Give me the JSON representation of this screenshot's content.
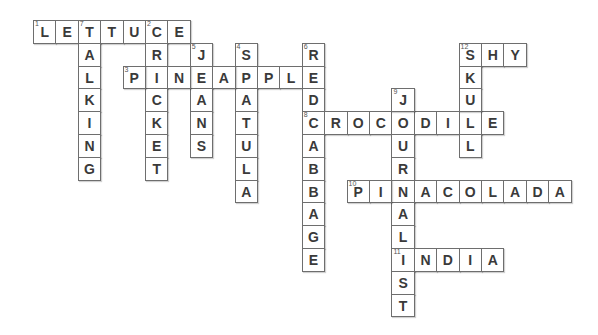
{
  "puzzle": {
    "type": "crossword",
    "grid_origin": {
      "x": 33,
      "y": 20
    },
    "cell_size": {
      "w": 22.4,
      "h": 22.8
    },
    "colors": {
      "border": "#6e6e6e",
      "letter": "#3a3a3a",
      "background": "#ffffff"
    },
    "words": [
      {
        "number": "1",
        "direction": "across",
        "row": 0,
        "col": 0,
        "answer": "LETTUCE"
      },
      {
        "number": "2",
        "direction": "down",
        "row": 0,
        "col": 5,
        "answer": "CRICKET"
      },
      {
        "number": "3",
        "direction": "across",
        "row": 2,
        "col": 4,
        "answer": "PINEAPPLE"
      },
      {
        "number": "4",
        "direction": "down",
        "row": 1,
        "col": 9,
        "answer": "SPATULA"
      },
      {
        "number": "5",
        "direction": "down",
        "row": 1,
        "col": 7,
        "answer": "JEANS"
      },
      {
        "number": "6",
        "direction": "down",
        "row": 1,
        "col": 12,
        "answer": "REDCABBAGE"
      },
      {
        "number": "7",
        "direction": "down",
        "row": 0,
        "col": 2,
        "answer": "TALKING"
      },
      {
        "number": "8",
        "direction": "across",
        "row": 4,
        "col": 12,
        "answer": "CROCODILE"
      },
      {
        "number": "9",
        "direction": "down",
        "row": 3,
        "col": 16,
        "answer": "JOURNALIST"
      },
      {
        "number": "10",
        "direction": "across",
        "row": 7,
        "col": 14,
        "answer": "PINACOLADA"
      },
      {
        "number": "11",
        "direction": "across",
        "row": 10,
        "col": 16,
        "answer": "INDIA"
      },
      {
        "number": "12",
        "direction": "across",
        "row": 1,
        "col": 19,
        "answer": "SHY"
      },
      {
        "number": "12",
        "direction": "down",
        "row": 1,
        "col": 19,
        "answer": "SKULL"
      }
    ],
    "cells": [
      {
        "r": 0,
        "c": 0,
        "ch": "L",
        "n": "1"
      },
      {
        "r": 0,
        "c": 1,
        "ch": "E"
      },
      {
        "r": 0,
        "c": 2,
        "ch": "T",
        "n": "7"
      },
      {
        "r": 0,
        "c": 3,
        "ch": "T"
      },
      {
        "r": 0,
        "c": 4,
        "ch": "U"
      },
      {
        "r": 0,
        "c": 5,
        "ch": "C",
        "n": "2"
      },
      {
        "r": 0,
        "c": 6,
        "ch": "E"
      },
      {
        "r": 1,
        "c": 2,
        "ch": "A"
      },
      {
        "r": 2,
        "c": 2,
        "ch": "L"
      },
      {
        "r": 3,
        "c": 2,
        "ch": "K"
      },
      {
        "r": 4,
        "c": 2,
        "ch": "I"
      },
      {
        "r": 5,
        "c": 2,
        "ch": "N"
      },
      {
        "r": 6,
        "c": 2,
        "ch": "G"
      },
      {
        "r": 1,
        "c": 5,
        "ch": "R"
      },
      {
        "r": 2,
        "c": 5,
        "ch": "I"
      },
      {
        "r": 3,
        "c": 5,
        "ch": "C"
      },
      {
        "r": 4,
        "c": 5,
        "ch": "K"
      },
      {
        "r": 5,
        "c": 5,
        "ch": "E"
      },
      {
        "r": 6,
        "c": 5,
        "ch": "T"
      },
      {
        "r": 1,
        "c": 7,
        "ch": "J",
        "n": "5"
      },
      {
        "r": 2,
        "c": 7,
        "ch": "E"
      },
      {
        "r": 3,
        "c": 7,
        "ch": "A"
      },
      {
        "r": 4,
        "c": 7,
        "ch": "N"
      },
      {
        "r": 5,
        "c": 7,
        "ch": "S"
      },
      {
        "r": 1,
        "c": 9,
        "ch": "S",
        "n": "4"
      },
      {
        "r": 2,
        "c": 9,
        "ch": "P"
      },
      {
        "r": 3,
        "c": 9,
        "ch": "A"
      },
      {
        "r": 4,
        "c": 9,
        "ch": "T"
      },
      {
        "r": 5,
        "c": 9,
        "ch": "U"
      },
      {
        "r": 6,
        "c": 9,
        "ch": "L"
      },
      {
        "r": 7,
        "c": 9,
        "ch": "A"
      },
      {
        "r": 2,
        "c": 4,
        "ch": "P",
        "n": "3"
      },
      {
        "r": 2,
        "c": 6,
        "ch": "N"
      },
      {
        "r": 2,
        "c": 8,
        "ch": "A"
      },
      {
        "r": 2,
        "c": 10,
        "ch": "P"
      },
      {
        "r": 2,
        "c": 11,
        "ch": "L"
      },
      {
        "r": 1,
        "c": 12,
        "ch": "R",
        "n": "6"
      },
      {
        "r": 2,
        "c": 12,
        "ch": "E"
      },
      {
        "r": 3,
        "c": 12,
        "ch": "D"
      },
      {
        "r": 4,
        "c": 12,
        "ch": "C",
        "n": "8"
      },
      {
        "r": 5,
        "c": 12,
        "ch": "A"
      },
      {
        "r": 6,
        "c": 12,
        "ch": "B"
      },
      {
        "r": 7,
        "c": 12,
        "ch": "B"
      },
      {
        "r": 8,
        "c": 12,
        "ch": "A"
      },
      {
        "r": 9,
        "c": 12,
        "ch": "G"
      },
      {
        "r": 10,
        "c": 12,
        "ch": "E"
      },
      {
        "r": 4,
        "c": 13,
        "ch": "R"
      },
      {
        "r": 4,
        "c": 14,
        "ch": "O"
      },
      {
        "r": 4,
        "c": 15,
        "ch": "C"
      },
      {
        "r": 4,
        "c": 16,
        "ch": "O"
      },
      {
        "r": 4,
        "c": 17,
        "ch": "D"
      },
      {
        "r": 4,
        "c": 18,
        "ch": "I"
      },
      {
        "r": 4,
        "c": 19,
        "ch": "L"
      },
      {
        "r": 4,
        "c": 20,
        "ch": "E"
      },
      {
        "r": 3,
        "c": 16,
        "ch": "J",
        "n": "9"
      },
      {
        "r": 5,
        "c": 16,
        "ch": "U"
      },
      {
        "r": 6,
        "c": 16,
        "ch": "R"
      },
      {
        "r": 7,
        "c": 16,
        "ch": "N"
      },
      {
        "r": 8,
        "c": 16,
        "ch": "A"
      },
      {
        "r": 9,
        "c": 16,
        "ch": "L"
      },
      {
        "r": 10,
        "c": 16,
        "ch": "I",
        "n": "11"
      },
      {
        "r": 11,
        "c": 16,
        "ch": "S"
      },
      {
        "r": 12,
        "c": 16,
        "ch": "T"
      },
      {
        "r": 1,
        "c": 19,
        "ch": "S",
        "n": "12"
      },
      {
        "r": 1,
        "c": 20,
        "ch": "H"
      },
      {
        "r": 1,
        "c": 21,
        "ch": "Y"
      },
      {
        "r": 2,
        "c": 19,
        "ch": "K"
      },
      {
        "r": 3,
        "c": 19,
        "ch": "U"
      },
      {
        "r": 5,
        "c": 19,
        "ch": "L"
      },
      {
        "r": 7,
        "c": 14,
        "ch": "P",
        "n": "10"
      },
      {
        "r": 7,
        "c": 15,
        "ch": "I"
      },
      {
        "r": 7,
        "c": 17,
        "ch": "A"
      },
      {
        "r": 7,
        "c": 18,
        "ch": "C"
      },
      {
        "r": 7,
        "c": 19,
        "ch": "O"
      },
      {
        "r": 7,
        "c": 20,
        "ch": "L"
      },
      {
        "r": 7,
        "c": 21,
        "ch": "A"
      },
      {
        "r": 7,
        "c": 22,
        "ch": "D"
      },
      {
        "r": 7,
        "c": 23,
        "ch": "A"
      },
      {
        "r": 10,
        "c": 17,
        "ch": "N"
      },
      {
        "r": 10,
        "c": 18,
        "ch": "D"
      },
      {
        "r": 10,
        "c": 19,
        "ch": "I"
      },
      {
        "r": 10,
        "c": 20,
        "ch": "A"
      }
    ]
  }
}
